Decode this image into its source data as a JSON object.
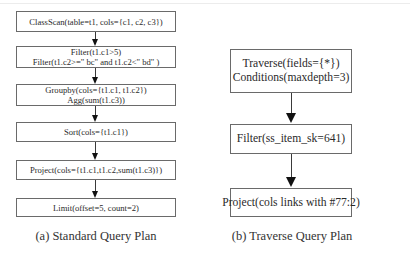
{
  "standard_plan": {
    "caption": "(a) Standard Query Plan",
    "nodes": [
      {
        "lines": [
          "ClassScan(table=t1, cols={c1, c2, c3})"
        ]
      },
      {
        "lines": [
          "Filter(t1.c1>5)",
          "Filter(t1.c2>=\" bc\" and t1.c2<\" bd\" )"
        ]
      },
      {
        "lines": [
          "Groupby(cols={t1.c1, t1.c2})",
          "Agg(sum(t1.c3))"
        ]
      },
      {
        "lines": [
          "Sort(cols={t1.c1})"
        ]
      },
      {
        "lines": [
          "Project(cols={t1.c1,t1.c2,sum(t1.c3)})"
        ]
      },
      {
        "lines": [
          "Limit(offset=5, count=2)"
        ]
      }
    ]
  },
  "traverse_plan": {
    "caption": "(b) Traverse Query Plan",
    "nodes": [
      {
        "lines": [
          "Traverse(fields={*})",
          "Conditions(maxdepth=3)"
        ]
      },
      {
        "lines": [
          "Filter(ss_item_sk=641)"
        ]
      },
      {
        "lines": [
          "Project(cols links with #77:2)"
        ]
      }
    ]
  }
}
